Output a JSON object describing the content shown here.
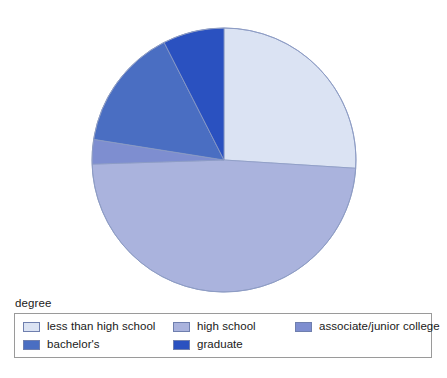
{
  "legend": {
    "title": "degree",
    "position": "bottom"
  },
  "chart_data": {
    "type": "pie",
    "title": "",
    "subtitle": "",
    "xlabel": "",
    "ylabel": "",
    "legend_title": "degree",
    "legend_position": "bottom",
    "grid": false,
    "start_angle_deg": 0,
    "direction": "clockwise",
    "categories": [
      "less than high school",
      "high school",
      "associate/junior college",
      "bachelor's",
      "graduate"
    ],
    "values": [
      26.0,
      48.5,
      3.0,
      15.0,
      7.5
    ],
    "units": "percent",
    "slices": [
      {
        "label": "less than high school",
        "value": 26.0,
        "color": "#dbe3f3",
        "start_deg": 0,
        "end_deg": 93.6
      },
      {
        "label": "high school",
        "value": 48.5,
        "color": "#aab3dd",
        "start_deg": 93.6,
        "end_deg": 268.2
      },
      {
        "label": "associate/junior college",
        "value": 3.0,
        "color": "#7e8ed0",
        "start_deg": 268.2,
        "end_deg": 279.0
      },
      {
        "label": "bachelor's",
        "value": 15.0,
        "color": "#4a6ec2",
        "start_deg": 279.0,
        "end_deg": 333.0
      },
      {
        "label": "graduate",
        "value": 7.5,
        "color": "#2a51c0",
        "start_deg": 333.0,
        "end_deg": 360.0
      }
    ]
  },
  "colors": {
    "less_than_high_school": "#dbe3f3",
    "high_school": "#aab3dd",
    "associate_junior_college": "#7e8ed0",
    "bachelors": "#4a6ec2",
    "graduate": "#2a51c0",
    "slice_outline": "#8d9cc4",
    "legend_border": "#9a9a9a",
    "background": "#ffffff",
    "text": "#1a1a1a"
  }
}
